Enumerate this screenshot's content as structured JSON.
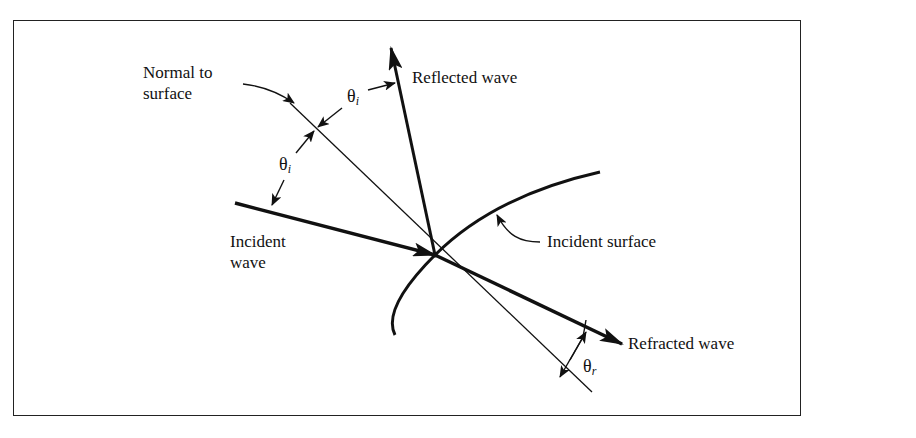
{
  "diagram": {
    "labels": {
      "normal": [
        "Normal to",
        "surface"
      ],
      "reflected": "Reflected wave",
      "incident_wave": [
        "Incident",
        "wave"
      ],
      "incident_surface": "Incident surface",
      "refracted": "Refracted wave"
    },
    "angles": {
      "theta_symbol": "θ",
      "incident_sub": "i",
      "refracted_sub": "r"
    }
  }
}
